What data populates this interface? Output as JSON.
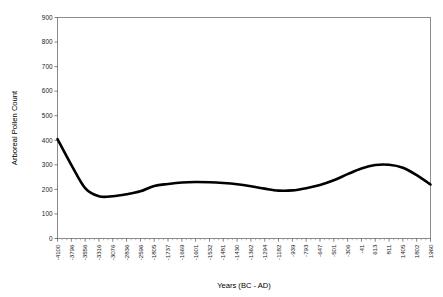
{
  "chart_data": {
    "type": "line",
    "title": "",
    "xlabel": "Years (BC - AD)",
    "ylabel": "Arboreal Pollen Count",
    "ylim": [
      0,
      900
    ],
    "yticks": [
      0,
      100,
      200,
      300,
      400,
      500,
      600,
      700,
      800,
      900
    ],
    "grid": false,
    "legend": null,
    "categories": [
      "-4100",
      "-3796",
      "-3556",
      "-3316",
      "-3076",
      "-2836",
      "-2596",
      "-1805",
      "-1737",
      "-1669",
      "-1601",
      "-1532",
      "-1481",
      "-1430",
      "-1362",
      "-1294",
      "-1182",
      "-939",
      "-793",
      "-647",
      "-501",
      "-306",
      "-41",
      "613",
      "811",
      "1405",
      "1802",
      "1960"
    ],
    "series": [
      {
        "name": "Arboreal Pollen Count",
        "values": [
          405,
          300,
          205,
          172,
          172,
          180,
          192,
          214,
          222,
          228,
          230,
          229,
          226,
          221,
          213,
          203,
          195,
          196,
          205,
          218,
          237,
          262,
          285,
          299,
          300,
          288,
          258,
          220
        ]
      }
    ]
  },
  "axes": {
    "y_title": "Arboreal Pollen Count",
    "x_title": "Years (BC - AD)",
    "y_tick_labels": [
      "900",
      "800",
      "700",
      "600",
      "500",
      "400",
      "300",
      "200",
      "100",
      "0"
    ],
    "x_tick_labels": [
      "-4100",
      "-3796",
      "-3556",
      "-3316",
      "-3076",
      "-2836",
      "-2596",
      "-1805",
      "-1737",
      "-1669",
      "-1601",
      "-1532",
      "-1481",
      "-1430",
      "-1362",
      "-1294",
      "-1182",
      "-939",
      "-793",
      "-647",
      "-501",
      "-306",
      "-41",
      "613",
      "811",
      "1405",
      "1802",
      "1960"
    ]
  },
  "style": {
    "line_color": "#000000",
    "frame_color": "#808080",
    "text_color": "#1a1a1a",
    "background": "#ffffff"
  }
}
